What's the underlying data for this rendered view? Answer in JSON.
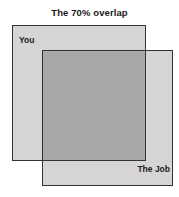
{
  "title": "The 70% overlap",
  "diagram": {
    "type": "venn-square",
    "overlap_percent": 70,
    "sets": [
      {
        "id": "you",
        "label": "You",
        "fill_color": "#d5d5d5",
        "border_color": "#333333",
        "label_position": "top-left"
      },
      {
        "id": "job",
        "label": "The Job",
        "fill_color": "#d5d5d5",
        "border_color": "#333333",
        "label_position": "bottom-right"
      }
    ],
    "intersection": {
      "label": "",
      "fill_color": "#a8a8a8",
      "border_color": "#333333"
    },
    "background_color": "#ffffff",
    "title_color": "#1a1a1a"
  }
}
